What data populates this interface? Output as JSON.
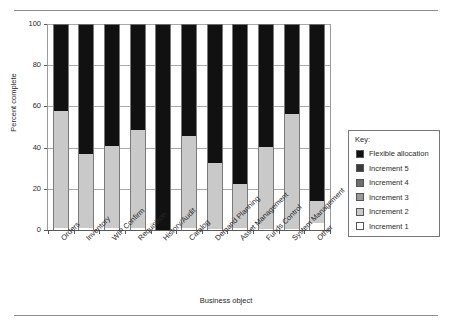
{
  "chart_data": {
    "type": "bar",
    "stacked": true,
    "title": "",
    "xlabel": "Business object",
    "ylabel": "Percent complete",
    "ylim": [
      0,
      100
    ],
    "yticks": [
      0,
      20,
      40,
      60,
      80,
      100
    ],
    "grid": true,
    "legend_position": "right",
    "legend_title": "Key:",
    "categories": [
      "Orders",
      "Inventory",
      "WIP Confirm",
      "Requisition",
      "History/Audit",
      "Catalog",
      "Demand Planning",
      "Asset Management",
      "Funds Control",
      "System Management",
      "Other"
    ],
    "series": [
      {
        "name": "Increment 1",
        "color": "#ffffff",
        "values": [
          1,
          1,
          1,
          1,
          0,
          1,
          0.5,
          1,
          0.5,
          0.5,
          3.5
        ]
      },
      {
        "name": "Increment 2",
        "color": "#c9c9c9",
        "values": [
          57,
          36,
          40,
          47.5,
          0,
          44.5,
          32,
          21.5,
          40,
          56,
          10.5
        ]
      },
      {
        "name": "Increment 3",
        "color": "#9a9a9a",
        "values": [
          0,
          0,
          0,
          0,
          0,
          0,
          0,
          0,
          0,
          0,
          0
        ]
      },
      {
        "name": "Increment 4",
        "color": "#6e6e6e",
        "values": [
          0,
          0,
          0,
          0,
          0,
          0,
          0,
          0,
          0,
          0,
          0
        ]
      },
      {
        "name": "Increment 5",
        "color": "#3b3b3b",
        "values": [
          0,
          0,
          0,
          0,
          0,
          0,
          0,
          0,
          0,
          0,
          0
        ]
      },
      {
        "name": "Flexible allocation",
        "color": "#111111",
        "values": [
          42,
          63,
          59,
          51.5,
          100,
          54.5,
          67.5,
          77.5,
          59.5,
          43.5,
          86
        ]
      }
    ],
    "legend_entries": [
      {
        "label": "Flexible allocation",
        "color": "#111111"
      },
      {
        "label": "Increment 5",
        "color": "#3b3b3b"
      },
      {
        "label": "Increment 4",
        "color": "#6e6e6e"
      },
      {
        "label": "Increment 3",
        "color": "#9a9a9a"
      },
      {
        "label": "Increment 2",
        "color": "#c9c9c9"
      },
      {
        "label": "Increment 1",
        "color": "#ffffff"
      }
    ]
  }
}
